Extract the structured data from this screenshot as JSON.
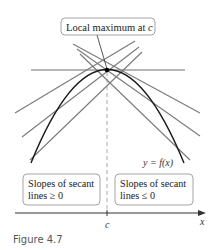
{
  "figure": {
    "caption": "Figure 4.7",
    "label_box": {
      "text_prefix": "Local maximum at ",
      "text_var": "c"
    },
    "curve_label": "y = f(x)",
    "left_box": {
      "line1": "Slopes of secant",
      "line2": "lines ≥ 0"
    },
    "right_box": {
      "line1": "Slopes of secant",
      "line2": "lines ≤ 0"
    },
    "x_tick_label": "c",
    "x_axis_label": "x"
  },
  "colors": {
    "curve": "#1a1a1a",
    "secant": "#7a7a7a",
    "tangent": "#6e6e6e",
    "box_border": "#9a9a9a",
    "dashed": "#a0a0a0",
    "caption": "#555555"
  }
}
